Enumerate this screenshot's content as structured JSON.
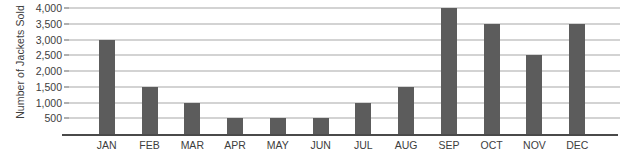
{
  "chart_data": {
    "type": "bar",
    "title": "",
    "subtitle": "",
    "xlabel": "",
    "ylabel": "Number of Jackets Sold",
    "categories": [
      "JAN",
      "FEB",
      "MAR",
      "APR",
      "MAY",
      "JUN",
      "JUL",
      "AUG",
      "SEP",
      "OCT",
      "NOV",
      "DEC"
    ],
    "values": [
      3000,
      1500,
      1000,
      500,
      500,
      500,
      1000,
      1500,
      4000,
      3500,
      2500,
      3500
    ],
    "ylim": [
      0,
      4000
    ],
    "ytick_values": [
      500,
      1000,
      1500,
      2000,
      2500,
      3000,
      3500,
      4000
    ],
    "ytick_labels": [
      "500",
      "1,000",
      "1,500",
      "2,000",
      "2,500",
      "3,000",
      "3,500",
      "4,000"
    ],
    "grid": true,
    "grid_axis": "y",
    "legend": false,
    "legend_position": "none",
    "bar_color": "#5c5c5c",
    "gridline_color": "#a8a8a8",
    "axis_color": "#4a4a4a",
    "text_color": "#3d3d3d",
    "background_color": "#ffffff"
  }
}
